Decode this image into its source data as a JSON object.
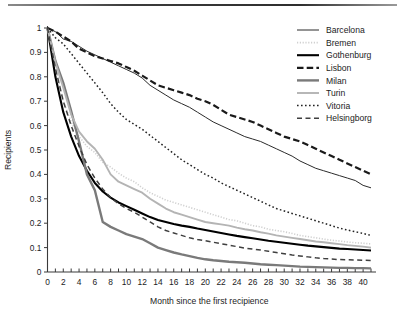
{
  "figure": {
    "has_top_rule": true
  },
  "chart_data": {
    "type": "line",
    "title": "",
    "xlabel": "Month since the first recipience",
    "ylabel": "Recipients",
    "xlim": [
      0,
      41
    ],
    "ylim": [
      0,
      1
    ],
    "grid": false,
    "legend_position": "top-right",
    "x_tick_labels": [
      "0",
      "2",
      "4",
      "6",
      "8",
      "10",
      "12",
      "14",
      "16",
      "18",
      "20",
      "22",
      "24",
      "26",
      "28",
      "30",
      "32",
      "34",
      "36",
      "38",
      "40"
    ],
    "x_tick_values": [
      0,
      2,
      4,
      6,
      8,
      10,
      12,
      14,
      16,
      18,
      20,
      22,
      24,
      26,
      28,
      30,
      32,
      34,
      36,
      38,
      40
    ],
    "x_minor_tick_step": 1,
    "y_tick_labels": [
      "0",
      "0.1",
      "0.2",
      "0.3",
      "0.4",
      "0.5",
      "0.6",
      "0.7",
      "0.8",
      "0.9",
      "1"
    ],
    "y_tick_values": [
      0,
      0.1,
      0.2,
      0.3,
      0.4,
      0.5,
      0.6,
      0.7,
      0.8,
      0.9,
      1
    ],
    "x": [
      0,
      1,
      2,
      3,
      4,
      5,
      6,
      7,
      8,
      9,
      10,
      11,
      12,
      13,
      14,
      15,
      16,
      17,
      18,
      19,
      20,
      21,
      22,
      23,
      24,
      25,
      26,
      27,
      28,
      29,
      30,
      31,
      32,
      33,
      34,
      35,
      36,
      37,
      38,
      39,
      40,
      41
    ],
    "series": [
      {
        "name": "Barcelona",
        "color": "#2b2b2b",
        "width": 1.0,
        "dash": "none",
        "values": [
          1.0,
          0.985,
          0.955,
          0.945,
          0.925,
          0.905,
          0.89,
          0.875,
          0.86,
          0.845,
          0.83,
          0.815,
          0.795,
          0.765,
          0.745,
          0.725,
          0.705,
          0.69,
          0.675,
          0.655,
          0.635,
          0.615,
          0.6,
          0.585,
          0.57,
          0.555,
          0.545,
          0.535,
          0.52,
          0.505,
          0.49,
          0.475,
          0.455,
          0.44,
          0.425,
          0.415,
          0.405,
          0.395,
          0.385,
          0.375,
          0.355,
          0.345
        ]
      },
      {
        "name": "Bremen",
        "color": "#d0d0d0",
        "width": 1.6,
        "dash": "dotted-fine",
        "values": [
          1.0,
          0.84,
          0.7,
          0.615,
          0.555,
          0.515,
          0.49,
          0.45,
          0.43,
          0.405,
          0.385,
          0.37,
          0.345,
          0.325,
          0.31,
          0.295,
          0.285,
          0.275,
          0.265,
          0.255,
          0.245,
          0.235,
          0.225,
          0.215,
          0.21,
          0.2,
          0.19,
          0.185,
          0.175,
          0.17,
          0.165,
          0.158,
          0.15,
          0.145,
          0.14,
          0.135,
          0.13,
          0.127,
          0.123,
          0.12,
          0.118,
          0.115
        ]
      },
      {
        "name": "Gothenburg",
        "color": "#000000",
        "width": 2.1,
        "dash": "none",
        "values": [
          1.0,
          0.8,
          0.655,
          0.555,
          0.475,
          0.415,
          0.365,
          0.33,
          0.305,
          0.285,
          0.27,
          0.255,
          0.24,
          0.225,
          0.213,
          0.205,
          0.197,
          0.19,
          0.185,
          0.178,
          0.172,
          0.166,
          0.16,
          0.154,
          0.148,
          0.143,
          0.138,
          0.133,
          0.128,
          0.124,
          0.12,
          0.116,
          0.112,
          0.108,
          0.105,
          0.102,
          0.099,
          0.096,
          0.094,
          0.092,
          0.09,
          0.088
        ]
      },
      {
        "name": "Lisbon",
        "color": "#1a1a1a",
        "width": 2.2,
        "dash": "dashed-long",
        "values": [
          1.0,
          0.985,
          0.965,
          0.945,
          0.915,
          0.9,
          0.885,
          0.875,
          0.865,
          0.855,
          0.84,
          0.825,
          0.805,
          0.785,
          0.765,
          0.755,
          0.745,
          0.735,
          0.725,
          0.71,
          0.7,
          0.685,
          0.665,
          0.645,
          0.635,
          0.625,
          0.615,
          0.6,
          0.585,
          0.57,
          0.555,
          0.545,
          0.535,
          0.52,
          0.505,
          0.49,
          0.475,
          0.46,
          0.445,
          0.43,
          0.415,
          0.4
        ]
      },
      {
        "name": "Milan",
        "color": "#7a7a7a",
        "width": 2.4,
        "dash": "none",
        "values": [
          1.0,
          0.865,
          0.775,
          0.66,
          0.535,
          0.4,
          0.335,
          0.205,
          0.185,
          0.17,
          0.155,
          0.145,
          0.135,
          0.118,
          0.1,
          0.09,
          0.08,
          0.072,
          0.065,
          0.058,
          0.052,
          0.048,
          0.045,
          0.042,
          0.04,
          0.038,
          0.035,
          0.032,
          0.03,
          0.028,
          0.026,
          0.024,
          0.022,
          0.021,
          0.02,
          0.019,
          0.018,
          0.017,
          0.017,
          0.016,
          0.016,
          0.015
        ]
      },
      {
        "name": "Turin",
        "color": "#b4b4b4",
        "width": 1.9,
        "dash": "none",
        "values": [
          1.0,
          0.86,
          0.755,
          0.645,
          0.575,
          0.535,
          0.505,
          0.46,
          0.4,
          0.37,
          0.355,
          0.34,
          0.325,
          0.3,
          0.28,
          0.26,
          0.245,
          0.235,
          0.225,
          0.215,
          0.205,
          0.2,
          0.195,
          0.19,
          0.182,
          0.175,
          0.17,
          0.163,
          0.157,
          0.15,
          0.145,
          0.14,
          0.135,
          0.13,
          0.125,
          0.122,
          0.118,
          0.114,
          0.11,
          0.107,
          0.104,
          0.1
        ]
      },
      {
        "name": "Vitoria",
        "color": "#222222",
        "width": 1.5,
        "dash": "dotted",
        "values": [
          1.0,
          0.96,
          0.935,
          0.895,
          0.855,
          0.815,
          0.775,
          0.735,
          0.69,
          0.655,
          0.625,
          0.605,
          0.585,
          0.56,
          0.535,
          0.51,
          0.485,
          0.46,
          0.44,
          0.42,
          0.4,
          0.385,
          0.365,
          0.35,
          0.335,
          0.32,
          0.305,
          0.29,
          0.275,
          0.26,
          0.25,
          0.24,
          0.23,
          0.22,
          0.21,
          0.2,
          0.19,
          0.18,
          0.172,
          0.165,
          0.158,
          0.15
        ]
      },
      {
        "name": "Helsingborg",
        "color": "#3f3f3f",
        "width": 1.5,
        "dash": "dashed",
        "values": [
          1.0,
          0.835,
          0.7,
          0.6,
          0.515,
          0.44,
          0.385,
          0.34,
          0.305,
          0.28,
          0.26,
          0.245,
          0.225,
          0.205,
          0.185,
          0.17,
          0.16,
          0.15,
          0.14,
          0.133,
          0.128,
          0.122,
          0.116,
          0.11,
          0.104,
          0.098,
          0.094,
          0.09,
          0.085,
          0.08,
          0.075,
          0.07,
          0.066,
          0.062,
          0.058,
          0.055,
          0.053,
          0.051,
          0.05,
          0.049,
          0.048,
          0.047
        ]
      }
    ]
  }
}
